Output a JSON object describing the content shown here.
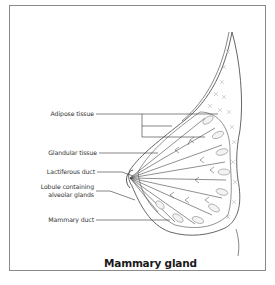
{
  "diagram": {
    "title": "Mammary gland",
    "labels": [
      {
        "id": "adipose",
        "text": "Adipose tissue"
      },
      {
        "id": "glandular",
        "text": "Glandular tissue"
      },
      {
        "id": "lactiferous",
        "text": "Lactiferous duct"
      },
      {
        "id": "lobule_line1",
        "text": "Lobule containing"
      },
      {
        "id": "lobule_line2",
        "text": "alveolar glands"
      },
      {
        "id": "mammary_duct",
        "text": "Mammary duct"
      }
    ],
    "colors": {
      "frame": "#8a8a8a",
      "line": "#333333",
      "adipose": "#b8b8b8"
    }
  }
}
